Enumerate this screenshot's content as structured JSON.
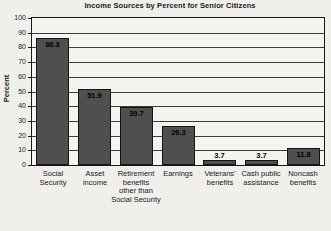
{
  "chart_data": {
    "type": "bar",
    "title": "Income Sources by Percent for Senior Citizens",
    "ylabel": "Percent",
    "xlabel": "",
    "ylim": [
      0,
      100
    ],
    "ytick_step": 10,
    "grid": true,
    "legend": "none",
    "categories": [
      "Social\nSecurity",
      "Asset\nincome",
      "Retirement\nbenefits\nother than\nSocial Security",
      "Earnings",
      "Veterans'\nbenefits",
      "Cash public\nassistance",
      "Noncash\nbenefits"
    ],
    "values": [
      86.3,
      51.9,
      39.7,
      26.3,
      3.7,
      3.7,
      11.8
    ],
    "value_labels": [
      "86.3",
      "51.9",
      "39.7",
      "26.3",
      "3.7",
      "3.7",
      "11.8"
    ],
    "ytick_labels": [
      "0",
      "10",
      "20",
      "30",
      "40",
      "50",
      "60",
      "70",
      "80",
      "90",
      "100"
    ],
    "colors": {
      "bar_fill": "#4f4f4f",
      "bar_border": "#141414",
      "value_label": "#000000",
      "grid_color": "#3c3c3c",
      "plot_bg": "#f5f4f1",
      "page_bg": "#f0efec",
      "text": "#1a1a1a"
    }
  }
}
